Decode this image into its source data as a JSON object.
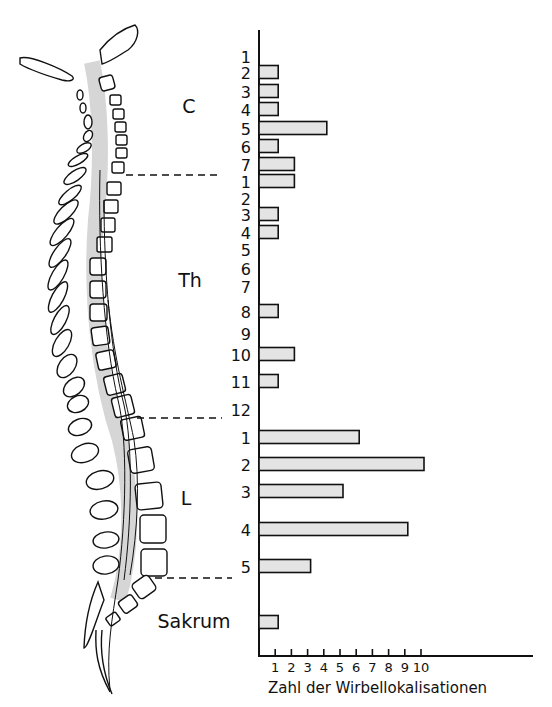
{
  "chart_data": {
    "type": "bar",
    "orientation": "horizontal",
    "title": "",
    "xlabel": "Zahl der Wirbellokalisationen",
    "ylabel": "",
    "xlim": [
      0,
      17
    ],
    "x_ticks": [
      1,
      2,
      3,
      4,
      5,
      6,
      7,
      8,
      9,
      10
    ],
    "grid": false,
    "legend": null,
    "regions": [
      {
        "name": "C",
        "label": "C"
      },
      {
        "name": "Th",
        "label": "Th"
      },
      {
        "name": "L",
        "label": "L"
      },
      {
        "name": "Sakrum",
        "label": "Sakrum"
      }
    ],
    "categories": [
      {
        "region": "C",
        "label": "1",
        "value": 0,
        "y": 56
      },
      {
        "region": "C",
        "label": "2",
        "value": 1,
        "y": 72
      },
      {
        "region": "C",
        "label": "3",
        "value": 1,
        "y": 91
      },
      {
        "region": "C",
        "label": "4",
        "value": 1,
        "y": 109
      },
      {
        "region": "C",
        "label": "5",
        "value": 4,
        "y": 128
      },
      {
        "region": "C",
        "label": "6",
        "value": 1,
        "y": 146
      },
      {
        "region": "C",
        "label": "7",
        "value": 2,
        "y": 164
      },
      {
        "region": "Th",
        "label": "1",
        "value": 2,
        "y": 181
      },
      {
        "region": "Th",
        "label": "2",
        "value": 0,
        "y": 198
      },
      {
        "region": "Th",
        "label": "3",
        "value": 1,
        "y": 214
      },
      {
        "region": "Th",
        "label": "4",
        "value": 1,
        "y": 232
      },
      {
        "region": "Th",
        "label": "5",
        "value": 0,
        "y": 249
      },
      {
        "region": "Th",
        "label": "6",
        "value": 0,
        "y": 268
      },
      {
        "region": "Th",
        "label": "7",
        "value": 0,
        "y": 286
      },
      {
        "region": "Th",
        "label": "8",
        "value": 1,
        "y": 311
      },
      {
        "region": "Th",
        "label": "9",
        "value": 0,
        "y": 333
      },
      {
        "region": "Th",
        "label": "10",
        "value": 2,
        "y": 354
      },
      {
        "region": "Th",
        "label": "11",
        "value": 1,
        "y": 381
      },
      {
        "region": "Th",
        "label": "12",
        "value": 0,
        "y": 409
      },
      {
        "region": "L",
        "label": "1",
        "value": 6,
        "y": 437
      },
      {
        "region": "L",
        "label": "2",
        "value": 10,
        "y": 464
      },
      {
        "region": "L",
        "label": "3",
        "value": 5,
        "y": 491
      },
      {
        "region": "L",
        "label": "4",
        "value": 9,
        "y": 529
      },
      {
        "region": "L",
        "label": "5",
        "value": 3,
        "y": 566
      },
      {
        "region": "Sakrum",
        "label": "",
        "value": 1,
        "y": 622
      }
    ]
  },
  "figure": {
    "region_labels": {
      "c": "C",
      "th": "Th",
      "l": "L",
      "sakrum": "Sakrum"
    },
    "axis_title": "Zahl der Wirbellokalisationen",
    "tick_labels": [
      "1",
      "2",
      "3",
      "4",
      "5",
      "6",
      "7",
      "8",
      "9",
      "10"
    ],
    "illustration": "spine-lateral-view"
  }
}
